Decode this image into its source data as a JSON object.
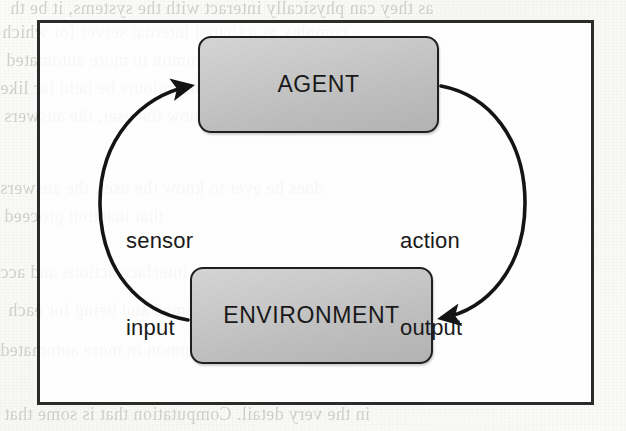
{
  "page": {
    "kind": "scanned-book-figure",
    "width": 626,
    "height": 431,
    "background_color": "#fdfdfc"
  },
  "diagram": {
    "type": "cycle",
    "frame": {
      "border_color": "#2b2b2b",
      "fill_color": "#ffffff"
    },
    "nodes": [
      {
        "id": "agent",
        "label": "AGENT",
        "shape": "rounded-rectangle",
        "fill_color": "#c6c6c6",
        "border_color": "#1f1f1f",
        "text_color": "#191919"
      },
      {
        "id": "environment",
        "label": "ENVIRONMENT",
        "shape": "rounded-rectangle",
        "fill_color": "#c6c6c6",
        "border_color": "#1f1f1f",
        "text_color": "#191919"
      }
    ],
    "edges": [
      {
        "id": "sensor-input",
        "from": "environment",
        "to": "agent",
        "side": "left",
        "direction": "upward",
        "label_line1": "sensor",
        "label_line2": "input",
        "stroke_color": "#141414"
      },
      {
        "id": "action-output",
        "from": "agent",
        "to": "environment",
        "side": "right",
        "direction": "downward",
        "label_line1": "action",
        "label_line2": "output",
        "stroke_color": "#141414"
      }
    ]
  },
  "background_showthrough": {
    "note": "faint mirrored text bleeding through from the reverse page of the scan",
    "color": "#b9b7b2",
    "lines": [
      "as they can physically interact with the systems, it be th",
      "complex as a shared internal server for which",
      "relation. It is not uncommon in more automated",
      "an internal concept and colours be held far like",
      "does he ever to know the user, the answers",
      "that inaction proceed",
      "software designed to interface actions and acc",
      "machine programmed and being for each",
      "in the very detail. Computation that is some that"
    ]
  }
}
